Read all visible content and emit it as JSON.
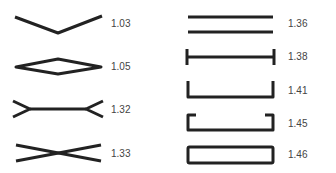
{
  "diagram": {
    "stroke_color": "#222222",
    "label_color": "#444444",
    "left_column": [
      {
        "shape": "v-shape",
        "value": "1.03"
      },
      {
        "shape": "lens-diamond",
        "value": "1.05"
      },
      {
        "shape": "forked-bar",
        "value": "1.32"
      },
      {
        "shape": "crossed-x",
        "value": "1.33"
      }
    ],
    "right_column": [
      {
        "shape": "double-bar",
        "value": "1.36"
      },
      {
        "shape": "i-beam",
        "value": "1.38"
      },
      {
        "shape": "u-channel",
        "value": "1.41"
      },
      {
        "shape": "lipped-channel",
        "value": "1.45"
      },
      {
        "shape": "hollow-rectangle",
        "value": "1.46"
      }
    ]
  }
}
